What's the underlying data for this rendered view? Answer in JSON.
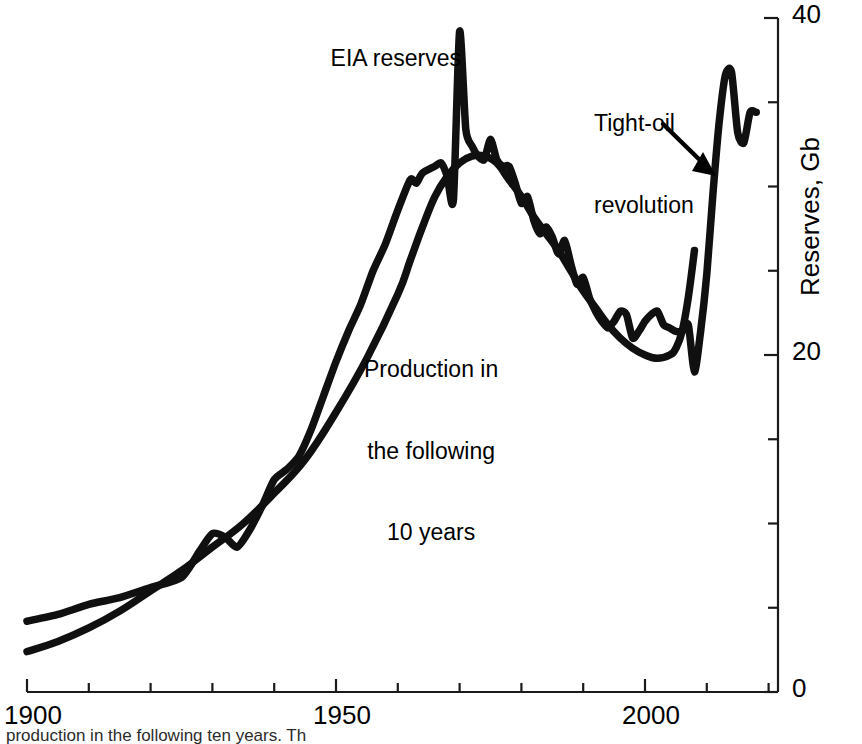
{
  "chart_data": {
    "type": "line",
    "title": "",
    "xlabel": "",
    "ylabel": "Reserves, Gb",
    "xlim": [
      1900,
      2021
    ],
    "ylim": [
      0,
      40
    ],
    "grid": false,
    "legend_position": "inline-annotations",
    "x_ticks_major": [
      1900,
      1950,
      2000
    ],
    "x_tick_labels": [
      "1900",
      "1950",
      "2000"
    ],
    "x_tick_interval_minor": 10,
    "y_ticks_major": [
      0,
      20,
      40
    ],
    "y_tick_labels": [
      "0",
      "20",
      "40"
    ],
    "y_tick_interval_minor": 5,
    "axis_position": "right-and-bottom",
    "series": [
      {
        "name": "EIA reserves",
        "color": "#000000",
        "points": [
          [
            1900,
            4.2
          ],
          [
            1905,
            4.6
          ],
          [
            1910,
            5.2
          ],
          [
            1915,
            5.6
          ],
          [
            1920,
            6.2
          ],
          [
            1925,
            6.8
          ],
          [
            1928,
            8.4
          ],
          [
            1930,
            9.4
          ],
          [
            1932,
            9.2
          ],
          [
            1934,
            8.6
          ],
          [
            1936,
            9.6
          ],
          [
            1938,
            11.0
          ],
          [
            1940,
            12.6
          ],
          [
            1942,
            13.2
          ],
          [
            1944,
            14.0
          ],
          [
            1946,
            15.6
          ],
          [
            1948,
            17.6
          ],
          [
            1950,
            19.6
          ],
          [
            1952,
            21.4
          ],
          [
            1954,
            23.0
          ],
          [
            1956,
            25.0
          ],
          [
            1958,
            26.6
          ],
          [
            1960,
            28.6
          ],
          [
            1962,
            30.4
          ],
          [
            1963,
            30.2
          ],
          [
            1964,
            30.8
          ],
          [
            1966,
            31.2
          ],
          [
            1967,
            31.4
          ],
          [
            1968,
            30.6
          ],
          [
            1969,
            29.2
          ],
          [
            1970,
            39.2
          ],
          [
            1971,
            33.4
          ],
          [
            1972,
            32.4
          ],
          [
            1973,
            31.8
          ],
          [
            1974,
            31.6
          ],
          [
            1975,
            32.8
          ],
          [
            1976,
            31.6
          ],
          [
            1977,
            31.2
          ],
          [
            1978,
            31.2
          ],
          [
            1979,
            30.2
          ],
          [
            1980,
            29.0
          ],
          [
            1981,
            29.4
          ],
          [
            1982,
            28.0
          ],
          [
            1983,
            27.2
          ],
          [
            1984,
            27.6
          ],
          [
            1985,
            27.0
          ],
          [
            1986,
            26.0
          ],
          [
            1987,
            26.8
          ],
          [
            1988,
            25.4
          ],
          [
            1989,
            24.2
          ],
          [
            1990,
            24.6
          ],
          [
            1991,
            23.4
          ],
          [
            1992,
            22.6
          ],
          [
            1993,
            22.0
          ],
          [
            1994,
            21.6
          ],
          [
            1995,
            22.0
          ],
          [
            1996,
            22.6
          ],
          [
            1997,
            22.4
          ],
          [
            1998,
            21.0
          ],
          [
            1999,
            21.4
          ],
          [
            2000,
            22.0
          ],
          [
            2001,
            22.4
          ],
          [
            2002,
            22.6
          ],
          [
            2003,
            21.8
          ],
          [
            2004,
            21.6
          ],
          [
            2005,
            21.4
          ],
          [
            2006,
            21.4
          ],
          [
            2007,
            21.8
          ],
          [
            2008,
            19.0
          ],
          [
            2009,
            21.4
          ],
          [
            2010,
            24.8
          ],
          [
            2011,
            29.6
          ],
          [
            2012,
            33.8
          ],
          [
            2013,
            36.6
          ],
          [
            2014,
            36.8
          ],
          [
            2015,
            33.2
          ],
          [
            2016,
            32.6
          ],
          [
            2017,
            34.4
          ],
          [
            2018,
            34.4
          ]
        ]
      },
      {
        "name": "Production in the following 10 years",
        "color": "#000000",
        "points": [
          [
            1900,
            2.4
          ],
          [
            1905,
            3.0
          ],
          [
            1910,
            3.8
          ],
          [
            1915,
            4.8
          ],
          [
            1920,
            6.0
          ],
          [
            1925,
            7.2
          ],
          [
            1930,
            8.6
          ],
          [
            1935,
            10.0
          ],
          [
            1940,
            11.8
          ],
          [
            1945,
            13.8
          ],
          [
            1950,
            16.6
          ],
          [
            1955,
            19.8
          ],
          [
            1960,
            23.6
          ],
          [
            1962,
            25.6
          ],
          [
            1964,
            27.6
          ],
          [
            1966,
            29.4
          ],
          [
            1968,
            30.6
          ],
          [
            1970,
            31.4
          ],
          [
            1972,
            31.8
          ],
          [
            1974,
            31.8
          ],
          [
            1976,
            31.4
          ],
          [
            1978,
            30.4
          ],
          [
            1980,
            29.4
          ],
          [
            1982,
            28.2
          ],
          [
            1984,
            27.2
          ],
          [
            1986,
            26.2
          ],
          [
            1988,
            25.0
          ],
          [
            1990,
            23.8
          ],
          [
            1992,
            22.8
          ],
          [
            1994,
            21.8
          ],
          [
            1996,
            21.0
          ],
          [
            1998,
            20.4
          ],
          [
            2000,
            20.0
          ],
          [
            2002,
            19.8
          ],
          [
            2004,
            20.0
          ],
          [
            2005,
            20.4
          ],
          [
            2006,
            21.4
          ],
          [
            2007,
            23.4
          ],
          [
            2008,
            26.2
          ]
        ]
      }
    ],
    "annotations": [
      {
        "id": "eia-reserves",
        "text": "EIA reserves",
        "x": 1946,
        "y": 38.5
      },
      {
        "id": "tight-oil-revolution",
        "text": "Tight-oil\nrevolution",
        "x": 1993,
        "y": 36.0,
        "has_arrow": true
      },
      {
        "id": "production-following",
        "text": "Production in\nthe following\n10 years",
        "x": 1969,
        "y": 21.5
      }
    ]
  },
  "axes": {
    "x_labels": {
      "left": "1900",
      "mid": "1950",
      "right": "2000"
    },
    "y_labels": {
      "bottom": "0",
      "mid": "20",
      "top": "40"
    },
    "y_title": "Reserves, Gb"
  },
  "annotations": {
    "eia_reserves": "EIA reserves",
    "tight_oil_line1": "Tight-oil",
    "tight_oil_line2": "revolution",
    "production_line1": "Production in",
    "production_line2": "the following",
    "production_line3": "10 years"
  },
  "caption": {
    "text": "production in the following ten years. Th"
  }
}
